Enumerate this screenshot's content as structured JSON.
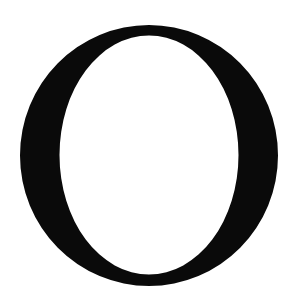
{
  "glyph": {
    "character": "O",
    "style": "serif",
    "fill_color": "#0a0a0a",
    "background_color": "#ffffff",
    "outer": {
      "cx": 149,
      "cy": 155.5,
      "rx": 129,
      "ry": 130.5
    },
    "inner": {
      "cx": 149,
      "cy": 155,
      "rx": 89.5,
      "ry": 119.5
    }
  }
}
